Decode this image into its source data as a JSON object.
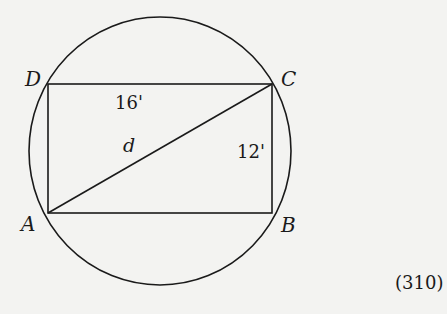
{
  "diagram": {
    "type": "rectangle inscribed in circle",
    "vertices": {
      "A": "A",
      "B": "B",
      "C": "C",
      "D": "D"
    },
    "labels": {
      "top_side": "16'",
      "right_side": "12'",
      "diagonal": "d"
    },
    "figure_number": "(310)",
    "colors": {
      "stroke": "#1a1a1a",
      "background": "#f3f3f1"
    }
  }
}
